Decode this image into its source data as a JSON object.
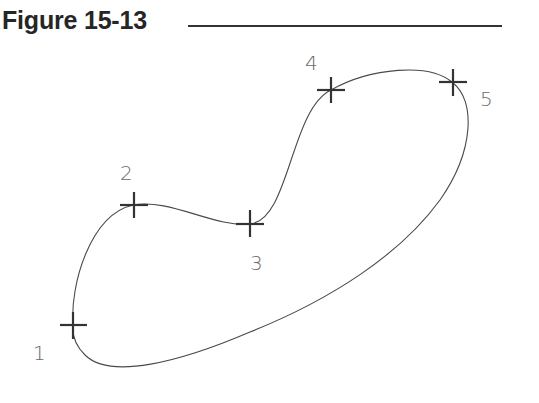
{
  "figure": {
    "title": "Figure 15-13",
    "colors": {
      "title": "#262626",
      "curve": "#4a4a4a",
      "marker": "#333333",
      "label": "#6a6a6a"
    }
  },
  "points": [
    {
      "id": "1",
      "label": "1",
      "x": 73,
      "y": 325,
      "label_x": 33,
      "label_y": 360
    },
    {
      "id": "2",
      "label": "2",
      "x": 133,
      "y": 205,
      "label_x": 120,
      "label_y": 180
    },
    {
      "id": "3",
      "label": "3",
      "x": 250,
      "y": 224,
      "label_x": 250,
      "label_y": 270
    },
    {
      "id": "4",
      "label": "4",
      "x": 331,
      "y": 90,
      "label_x": 305,
      "label_y": 70
    },
    {
      "id": "5",
      "label": "5",
      "x": 453,
      "y": 83,
      "label_x": 480,
      "label_y": 106
    }
  ]
}
